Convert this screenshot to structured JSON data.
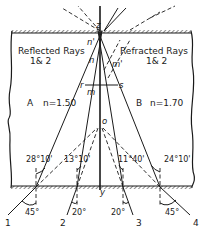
{
  "figure": {
    "regions": {
      "left": {
        "title_line1": "Reflected Rays",
        "title_line2": "1& 2",
        "medium_label": "A",
        "index_label": "n=1.50"
      },
      "right": {
        "title_line1": "Refracted Rays",
        "title_line2": "1& 2",
        "medium_label": "B",
        "index_label": "n=1.70"
      }
    },
    "points": {
      "z": "z",
      "n_prime": "n'",
      "n": "n",
      "m_prime": "m'",
      "r": "r",
      "m": "m",
      "s": "s",
      "o": "o",
      "y": "y"
    },
    "interior_angles": {
      "ray1": "28°10'",
      "ray2": "13°10'",
      "ray3": "11°40'",
      "ray4": "24°10'"
    },
    "incidence_angles": {
      "ray1": "45°",
      "ray2": "20°",
      "ray3": "20°",
      "ray4": "45°"
    },
    "ray_numbers": [
      "1",
      "2",
      "3",
      "4"
    ],
    "colors": {
      "ink": "#1a1a1a",
      "background": "#ffffff"
    }
  }
}
